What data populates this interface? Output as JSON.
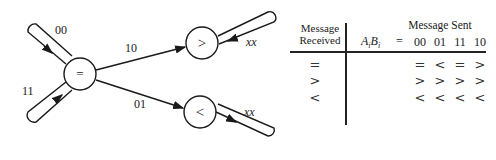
{
  "diagram": {
    "nodes": [
      {
        "id": "eq",
        "label": "="
      },
      {
        "id": "gt",
        "label": ">"
      },
      {
        "id": "lt",
        "label": "<"
      }
    ],
    "edges": [
      {
        "from": "eq",
        "to": "eq",
        "label": "00"
      },
      {
        "from": "eq",
        "to": "eq",
        "label": "11"
      },
      {
        "from": "eq",
        "to": "gt",
        "label": "10"
      },
      {
        "from": "eq",
        "to": "lt",
        "label": "01"
      },
      {
        "from": "gt",
        "to": "gt",
        "label": "xx"
      },
      {
        "from": "lt",
        "to": "lt",
        "label": "xx"
      }
    ]
  },
  "table": {
    "header_received_line1": "Message",
    "header_received_line2": "Received",
    "header_sent": "Message Sent",
    "ab_label_A": "A",
    "ab_label_i1": "i",
    "ab_label_B": "B",
    "ab_label_i2": "i",
    "equals": "=",
    "columns": [
      "00",
      "01",
      "11",
      "10"
    ],
    "rows": [
      {
        "received": "=",
        "cells": [
          "=",
          "<",
          "=",
          ">"
        ]
      },
      {
        "received": ">",
        "cells": [
          ">",
          ">",
          ">",
          ">"
        ]
      },
      {
        "received": "<",
        "cells": [
          "<",
          "<",
          "<",
          "<"
        ]
      }
    ]
  }
}
